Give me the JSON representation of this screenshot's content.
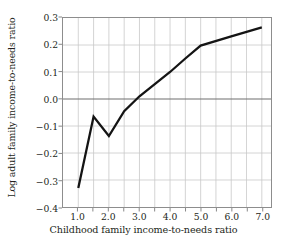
{
  "chart_data": {
    "type": "line",
    "title": "",
    "xlabel": "Childhood family income-to-needs ratio",
    "ylabel": "Log adult family income-to-needs ratio",
    "xlim": [
      0.5,
      7.3
    ],
    "ylim": [
      -0.4,
      0.3
    ],
    "xticks": [
      "1.0",
      "2.0",
      "3.0",
      "4.0",
      "5.0",
      "6.0",
      "7.0"
    ],
    "xtick_values": [
      1.0,
      2.0,
      3.0,
      4.0,
      5.0,
      6.0,
      7.0
    ],
    "yticks": [
      "0.3",
      "0.2",
      "0.1",
      "0.0",
      "−0.1",
      "−0.2",
      "−0.3",
      "−0.4"
    ],
    "ytick_values": [
      0.3,
      0.2,
      0.1,
      0.0,
      -0.1,
      -0.2,
      -0.3,
      -0.4
    ],
    "grid": true,
    "gridlines_x": [
      1.0,
      1.5,
      2.0,
      2.5,
      3.0,
      3.5,
      4.0,
      4.5,
      5.0,
      5.5,
      6.0,
      6.5,
      7.0
    ],
    "gridlines_y": [
      0.2,
      0.1,
      -0.1,
      -0.2,
      -0.3
    ],
    "zero_line": 0.0,
    "legend": null,
    "legend_position": "none",
    "series": [
      {
        "name": "Log adult family income-to-needs ratio",
        "color": "#141414",
        "x": [
          1.0,
          1.5,
          2.0,
          2.5,
          3.0,
          3.5,
          4.0,
          4.5,
          5.0,
          6.0,
          7.0
        ],
        "y": [
          -0.33,
          -0.065,
          -0.137,
          -0.045,
          0.01,
          0.055,
          0.1,
          0.15,
          0.198,
          0.232,
          0.265
        ]
      }
    ]
  },
  "figure": {
    "background_color": "#ffffff",
    "axis_color": "#8d8d8d",
    "grid_color": "#c9c9c9",
    "zero_line_color": "#6f6f6f",
    "text_color": "#231f20"
  }
}
